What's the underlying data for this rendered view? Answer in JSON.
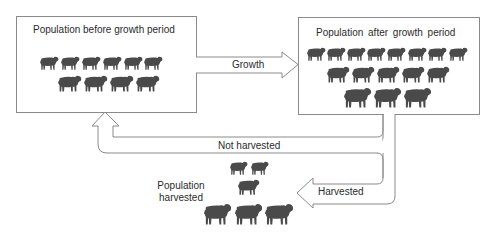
{
  "diagram": {
    "boxes": {
      "before": {
        "title": "Population before growth period"
      },
      "after": {
        "title": "Population after growth period"
      }
    },
    "arrows": {
      "growth": {
        "label": "Growth"
      },
      "not_harvested": {
        "label": "Not harvested"
      },
      "harvested": {
        "label": "Harvested"
      }
    },
    "harvested_group": {
      "label_line1": "Population",
      "label_line2": "harvested"
    },
    "colors": {
      "stroke": "#8a8a8a",
      "sheep": "#4a4a4a",
      "text": "#2b2b2b",
      "background": "#ffffff"
    },
    "sheep_counts": {
      "before": {
        "row1": 6,
        "row2": 4,
        "total": 10
      },
      "after": {
        "row1": 8,
        "row2": 5,
        "row3": 3,
        "total": 16
      },
      "harvested": {
        "row1": 2,
        "row2": 1,
        "row3": 3,
        "total": 6
      }
    },
    "sheep": {
      "before": [
        {
          "x": 40,
          "y": 56,
          "w": 19,
          "h": 14
        },
        {
          "x": 61,
          "y": 56,
          "w": 19,
          "h": 14
        },
        {
          "x": 82,
          "y": 56,
          "w": 19,
          "h": 14
        },
        {
          "x": 103,
          "y": 56,
          "w": 19,
          "h": 14
        },
        {
          "x": 124,
          "y": 56,
          "w": 19,
          "h": 14
        },
        {
          "x": 144,
          "y": 56,
          "w": 19,
          "h": 14
        },
        {
          "x": 58,
          "y": 75,
          "w": 24,
          "h": 17
        },
        {
          "x": 84,
          "y": 75,
          "w": 24,
          "h": 17
        },
        {
          "x": 110,
          "y": 75,
          "w": 24,
          "h": 17
        },
        {
          "x": 136,
          "y": 75,
          "w": 24,
          "h": 17
        }
      ],
      "after": [
        {
          "x": 307,
          "y": 47,
          "w": 19,
          "h": 14
        },
        {
          "x": 327,
          "y": 47,
          "w": 19,
          "h": 14
        },
        {
          "x": 347,
          "y": 47,
          "w": 19,
          "h": 14
        },
        {
          "x": 367,
          "y": 47,
          "w": 19,
          "h": 14
        },
        {
          "x": 387,
          "y": 47,
          "w": 19,
          "h": 14
        },
        {
          "x": 408,
          "y": 47,
          "w": 19,
          "h": 14
        },
        {
          "x": 428,
          "y": 47,
          "w": 19,
          "h": 14
        },
        {
          "x": 449,
          "y": 47,
          "w": 19,
          "h": 14
        },
        {
          "x": 327,
          "y": 66,
          "w": 23,
          "h": 17
        },
        {
          "x": 352,
          "y": 66,
          "w": 23,
          "h": 17
        },
        {
          "x": 377,
          "y": 66,
          "w": 23,
          "h": 17
        },
        {
          "x": 402,
          "y": 66,
          "w": 23,
          "h": 17
        },
        {
          "x": 427,
          "y": 66,
          "w": 23,
          "h": 17
        },
        {
          "x": 344,
          "y": 87,
          "w": 28,
          "h": 21
        },
        {
          "x": 374,
          "y": 87,
          "w": 28,
          "h": 21
        },
        {
          "x": 404,
          "y": 87,
          "w": 28,
          "h": 21
        }
      ],
      "harvested": [
        {
          "x": 230,
          "y": 161,
          "w": 18,
          "h": 14
        },
        {
          "x": 251,
          "y": 161,
          "w": 18,
          "h": 14
        },
        {
          "x": 238,
          "y": 179,
          "w": 22,
          "h": 16
        },
        {
          "x": 204,
          "y": 203,
          "w": 28,
          "h": 22
        },
        {
          "x": 235,
          "y": 203,
          "w": 28,
          "h": 22
        },
        {
          "x": 265,
          "y": 203,
          "w": 29,
          "h": 22
        }
      ]
    }
  }
}
